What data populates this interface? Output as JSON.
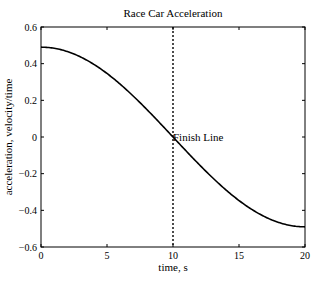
{
  "chart_data": {
    "type": "line",
    "title": "Race Car Acceleration",
    "xlabel": "time, s",
    "ylabel": "acceleration, velocity/time",
    "xlim": [
      0,
      20
    ],
    "ylim": [
      -0.6,
      0.6
    ],
    "xticks": [
      "0",
      "5",
      "10",
      "15",
      "20"
    ],
    "yticks": [
      "0.6",
      "0.4",
      "0.2",
      "0",
      "-0.2",
      "-0.4",
      "-0.6"
    ],
    "grid": false,
    "series": [
      {
        "name": "acceleration",
        "x": [
          0,
          1,
          2,
          3,
          4,
          5,
          6,
          7,
          8,
          9,
          10,
          11,
          12,
          13,
          14,
          15,
          16,
          17,
          18,
          19,
          20
        ],
        "values": [
          0.49,
          0.484,
          0.466,
          0.437,
          0.396,
          0.346,
          0.288,
          0.222,
          0.151,
          0.077,
          0.0,
          -0.077,
          -0.151,
          -0.222,
          -0.288,
          -0.346,
          -0.396,
          -0.437,
          -0.466,
          -0.484,
          -0.49
        ]
      }
    ],
    "annotations": [
      {
        "type": "vline",
        "x": 10,
        "style": "dotted"
      },
      {
        "type": "text",
        "x": 10,
        "y": 0,
        "text": "Finish Line"
      }
    ]
  }
}
